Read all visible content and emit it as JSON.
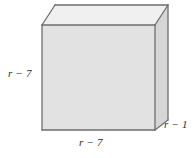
{
  "figure": {
    "type": "rectangular-prism-diagram",
    "title": "",
    "background_color": "#ffffff",
    "faces": {
      "front": {
        "name": "front-face",
        "fill": "#e2e2e2",
        "points": "42,25 155,25 155,130 42,130"
      },
      "top": {
        "name": "top-face",
        "fill": "#f0f0f0",
        "points": "42,25 55,5 168,5 155,25"
      },
      "right": {
        "name": "right-face",
        "fill": "#d6d6d6",
        "points": "155,25 168,5 168,120 155,130"
      }
    },
    "edges": {
      "color": "#6e6e6e",
      "width": 1.3
    },
    "labels": {
      "height": "r − 7",
      "width": "r − 7",
      "depth": "r − 1"
    },
    "label_meaning": {
      "height": "left vertical edge of front face",
      "width": "bottom horizontal edge of front face",
      "depth": "bottom slanted depth edge on right side"
    }
  }
}
